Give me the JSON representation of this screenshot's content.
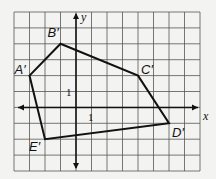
{
  "diagram": {
    "type": "coordinate-grid-polygon",
    "grid": {
      "cols": 12,
      "rows": 10,
      "x_min": -4,
      "x_max": 8,
      "y_min": -4,
      "y_max": 6
    },
    "axes": {
      "x_label": "x",
      "y_label": "y",
      "x_tick_label": "1",
      "y_tick_label": "1"
    },
    "vertices": [
      {
        "label": "A′",
        "x": -3,
        "y": 2
      },
      {
        "label": "B′",
        "x": -1,
        "y": 4
      },
      {
        "label": "C′",
        "x": 4,
        "y": 2
      },
      {
        "label": "D′",
        "x": 6,
        "y": -1
      },
      {
        "label": "E′",
        "x": -2,
        "y": -2
      }
    ],
    "colors": {
      "grid": "#555555",
      "polygon": "#111111",
      "background": "#f3f3f1"
    }
  }
}
